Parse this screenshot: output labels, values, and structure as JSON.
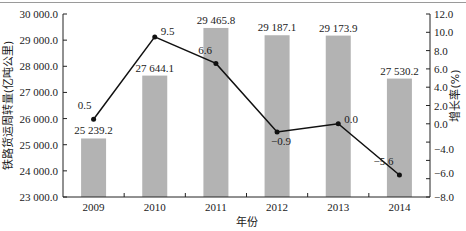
{
  "chart_data": {
    "type": "bar+line",
    "title": "",
    "xlabel": "年份",
    "ylabel": "铁路货运周转量(亿吨公里)",
    "y2label": "增长率(%)",
    "categories": [
      "2009",
      "2010",
      "2011",
      "2012",
      "2013",
      "2014"
    ],
    "series": [
      {
        "name": "铁路货运周转量(亿吨公里)",
        "type": "bar",
        "axis": "left",
        "values": [
          25239.2,
          27644.1,
          29465.8,
          29187.1,
          29173.9,
          27530.2
        ],
        "labels": [
          "25 239.2",
          "27 644.1",
          "29 465.8",
          "29 187.1",
          "29 173.9",
          "27 530.2"
        ],
        "color": "#b3b3b3"
      },
      {
        "name": "增长率(%)",
        "type": "line",
        "axis": "right",
        "values": [
          0.5,
          9.5,
          6.6,
          -0.9,
          0.0,
          -5.6
        ],
        "labels": [
          "0.5",
          "9.5",
          "6.6",
          "−0.9",
          "0.0",
          "−5.6"
        ],
        "color": "#111111"
      }
    ],
    "ylim": [
      23000,
      30000
    ],
    "y2lim": [
      -8,
      12
    ],
    "yticks": [
      "23 000.0",
      "24 000.0",
      "25 000.0",
      "26 000.0",
      "27 000.0",
      "28 000.0",
      "29 000.0",
      "30 000.0"
    ],
    "y2ticks": [
      "12.0",
      "10.0",
      "8.0",
      "6.0",
      "4.0",
      "2.0",
      "0.0",
      "−4.0",
      "−6.0",
      "−8.0"
    ],
    "grid": false,
    "legend": null
  }
}
